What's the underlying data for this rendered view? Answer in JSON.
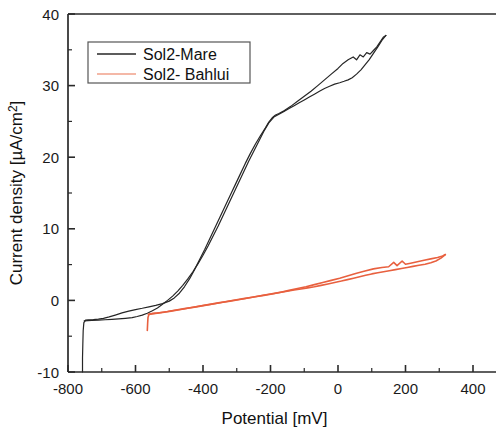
{
  "chart_data": {
    "type": "line",
    "title": "",
    "xlabel": "Potential [mV]",
    "ylabel": "Current density [µA/cm²]",
    "xlim": [
      -830,
      480
    ],
    "ylim": [
      -10,
      40
    ],
    "xticks": [
      -800,
      -600,
      -400,
      -200,
      0,
      200,
      400
    ],
    "xtick_labels": [
      "-800",
      "-600",
      "-400",
      "-200",
      "0",
      "200",
      "400"
    ],
    "yticks": [
      -10,
      0,
      10,
      20,
      30,
      40
    ],
    "ytick_labels": [
      "-10",
      "0",
      "10",
      "20",
      "30",
      "40"
    ],
    "x_minor_step": 100,
    "y_minor_step": 5,
    "grid": false,
    "legend_position": "upper-left",
    "series": [
      {
        "name": "Sol2-Mare",
        "color": "#262626",
        "linewidth": 1.2,
        "points_forward": [
          [
            -757,
            -10.0
          ],
          [
            -757,
            -8.0
          ],
          [
            -756,
            -6.0
          ],
          [
            -755,
            -4.2
          ],
          [
            -753,
            -3.1
          ],
          [
            -748,
            -2.75
          ],
          [
            -740,
            -2.7
          ],
          [
            -725,
            -2.68
          ],
          [
            -710,
            -2.62
          ],
          [
            -695,
            -2.5
          ],
          [
            -678,
            -2.3
          ],
          [
            -660,
            -2.05
          ],
          [
            -640,
            -1.75
          ],
          [
            -620,
            -1.5
          ],
          [
            -600,
            -1.28
          ],
          [
            -580,
            -1.1
          ],
          [
            -560,
            -0.9
          ],
          [
            -540,
            -0.7
          ],
          [
            -520,
            -0.45
          ],
          [
            -500,
            -0.1
          ],
          [
            -485,
            0.35
          ],
          [
            -470,
            1.0
          ],
          [
            -455,
            1.9
          ],
          [
            -440,
            3.0
          ],
          [
            -425,
            4.3
          ],
          [
            -410,
            5.7
          ],
          [
            -395,
            7.1
          ],
          [
            -380,
            8.6
          ],
          [
            -365,
            10.1
          ],
          [
            -350,
            11.6
          ],
          [
            -335,
            13.1
          ],
          [
            -320,
            14.6
          ],
          [
            -305,
            16.1
          ],
          [
            -290,
            17.6
          ],
          [
            -275,
            19.1
          ],
          [
            -260,
            20.5
          ],
          [
            -245,
            21.8
          ],
          [
            -230,
            23.0
          ],
          [
            -215,
            24.1
          ],
          [
            -205,
            24.9
          ],
          [
            -195,
            25.5
          ],
          [
            -185,
            25.9
          ],
          [
            -175,
            26.1
          ],
          [
            -160,
            26.5
          ],
          [
            -140,
            27.1
          ],
          [
            -120,
            27.8
          ],
          [
            -100,
            28.5
          ],
          [
            -80,
            29.2
          ],
          [
            -60,
            30.0
          ],
          [
            -40,
            30.8
          ],
          [
            -20,
            31.6
          ],
          [
            0,
            32.4
          ],
          [
            15,
            33.1
          ],
          [
            30,
            33.6
          ],
          [
            45,
            34.0
          ],
          [
            55,
            33.6
          ],
          [
            65,
            34.3
          ],
          [
            75,
            34.0
          ],
          [
            85,
            34.6
          ],
          [
            95,
            34.4
          ],
          [
            105,
            34.9
          ],
          [
            115,
            35.4
          ],
          [
            125,
            36.1
          ],
          [
            135,
            36.8
          ],
          [
            142,
            37.0
          ]
        ],
        "points_reverse": [
          [
            142,
            37.0
          ],
          [
            130,
            36.3
          ],
          [
            118,
            35.4
          ],
          [
            105,
            34.5
          ],
          [
            92,
            33.6
          ],
          [
            80,
            32.9
          ],
          [
            68,
            32.2
          ],
          [
            55,
            31.6
          ],
          [
            42,
            31.1
          ],
          [
            30,
            30.8
          ],
          [
            18,
            30.6
          ],
          [
            5,
            30.4
          ],
          [
            -10,
            30.2
          ],
          [
            -25,
            29.9
          ],
          [
            -40,
            29.6
          ],
          [
            -55,
            29.2
          ],
          [
            -70,
            28.8
          ],
          [
            -85,
            28.4
          ],
          [
            -100,
            28.0
          ],
          [
            -115,
            27.6
          ],
          [
            -130,
            27.2
          ],
          [
            -145,
            26.8
          ],
          [
            -160,
            26.4
          ],
          [
            -175,
            26.0
          ],
          [
            -190,
            25.6
          ],
          [
            -205,
            24.8
          ],
          [
            -220,
            23.6
          ],
          [
            -235,
            22.2
          ],
          [
            -250,
            20.8
          ],
          [
            -265,
            19.4
          ],
          [
            -280,
            17.9
          ],
          [
            -295,
            16.4
          ],
          [
            -310,
            14.9
          ],
          [
            -325,
            13.4
          ],
          [
            -340,
            11.9
          ],
          [
            -355,
            10.4
          ],
          [
            -370,
            9.0
          ],
          [
            -385,
            7.6
          ],
          [
            -400,
            6.3
          ],
          [
            -415,
            5.1
          ],
          [
            -430,
            4.0
          ],
          [
            -445,
            3.0
          ],
          [
            -460,
            2.1
          ],
          [
            -475,
            1.3
          ],
          [
            -490,
            0.6
          ],
          [
            -505,
            0.0
          ],
          [
            -520,
            -0.55
          ],
          [
            -535,
            -1.05
          ],
          [
            -550,
            -1.45
          ],
          [
            -565,
            -1.8
          ],
          [
            -580,
            -2.05
          ],
          [
            -595,
            -2.25
          ],
          [
            -610,
            -2.4
          ],
          [
            -630,
            -2.5
          ],
          [
            -650,
            -2.58
          ],
          [
            -670,
            -2.65
          ],
          [
            -690,
            -2.7
          ],
          [
            -710,
            -2.75
          ],
          [
            -730,
            -2.8
          ],
          [
            -752,
            -2.85
          ]
        ]
      },
      {
        "name": "Sol2- Bahlui",
        "color": "#E8603F",
        "linewidth": 1.6,
        "points_forward": [
          [
            -565,
            -4.2
          ],
          [
            -564,
            -3.2
          ],
          [
            -563,
            -2.4
          ],
          [
            -560,
            -1.95
          ],
          [
            -550,
            -1.85
          ],
          [
            -535,
            -1.78
          ],
          [
            -515,
            -1.65
          ],
          [
            -495,
            -1.5
          ],
          [
            -470,
            -1.3
          ],
          [
            -445,
            -1.1
          ],
          [
            -420,
            -0.9
          ],
          [
            -395,
            -0.7
          ],
          [
            -370,
            -0.5
          ],
          [
            -345,
            -0.3
          ],
          [
            -320,
            -0.1
          ],
          [
            -295,
            0.1
          ],
          [
            -270,
            0.3
          ],
          [
            -245,
            0.5
          ],
          [
            -220,
            0.7
          ],
          [
            -195,
            0.9
          ],
          [
            -170,
            1.15
          ],
          [
            -145,
            1.4
          ],
          [
            -120,
            1.65
          ],
          [
            -95,
            1.9
          ],
          [
            -70,
            2.2
          ],
          [
            -45,
            2.5
          ],
          [
            -20,
            2.8
          ],
          [
            5,
            3.1
          ],
          [
            30,
            3.45
          ],
          [
            55,
            3.8
          ],
          [
            80,
            4.1
          ],
          [
            105,
            4.4
          ],
          [
            130,
            4.6
          ],
          [
            150,
            4.7
          ],
          [
            165,
            5.3
          ],
          [
            175,
            4.85
          ],
          [
            190,
            5.5
          ],
          [
            200,
            5.05
          ],
          [
            215,
            5.2
          ],
          [
            235,
            5.4
          ],
          [
            255,
            5.6
          ],
          [
            275,
            5.8
          ],
          [
            295,
            6.0
          ],
          [
            310,
            6.2
          ],
          [
            318,
            6.4
          ]
        ],
        "points_reverse": [
          [
            318,
            6.4
          ],
          [
            305,
            5.9
          ],
          [
            290,
            5.5
          ],
          [
            275,
            5.25
          ],
          [
            258,
            5.05
          ],
          [
            240,
            4.9
          ],
          [
            222,
            4.75
          ],
          [
            205,
            4.6
          ],
          [
            188,
            4.45
          ],
          [
            170,
            4.3
          ],
          [
            152,
            4.15
          ],
          [
            135,
            4.0
          ],
          [
            118,
            3.85
          ],
          [
            100,
            3.7
          ],
          [
            82,
            3.5
          ],
          [
            64,
            3.3
          ],
          [
            46,
            3.1
          ],
          [
            28,
            2.9
          ],
          [
            10,
            2.7
          ],
          [
            -10,
            2.5
          ],
          [
            -30,
            2.3
          ],
          [
            -50,
            2.1
          ],
          [
            -70,
            1.9
          ],
          [
            -90,
            1.75
          ],
          [
            -110,
            1.6
          ],
          [
            -130,
            1.45
          ],
          [
            -155,
            1.25
          ],
          [
            -180,
            1.05
          ],
          [
            -205,
            0.85
          ],
          [
            -230,
            0.65
          ],
          [
            -255,
            0.45
          ],
          [
            -280,
            0.25
          ],
          [
            -305,
            0.05
          ],
          [
            -330,
            -0.15
          ],
          [
            -355,
            -0.35
          ],
          [
            -380,
            -0.55
          ],
          [
            -405,
            -0.75
          ],
          [
            -430,
            -0.95
          ],
          [
            -455,
            -1.15
          ],
          [
            -480,
            -1.35
          ],
          [
            -505,
            -1.55
          ],
          [
            -530,
            -1.72
          ],
          [
            -550,
            -1.85
          ],
          [
            -562,
            -1.95
          ]
        ]
      }
    ]
  },
  "legend": {
    "entries": [
      {
        "label": "Sol2-Mare",
        "color": "#262626"
      },
      {
        "label": "Sol2- Bahlui",
        "color": "#F0A08A"
      }
    ]
  }
}
